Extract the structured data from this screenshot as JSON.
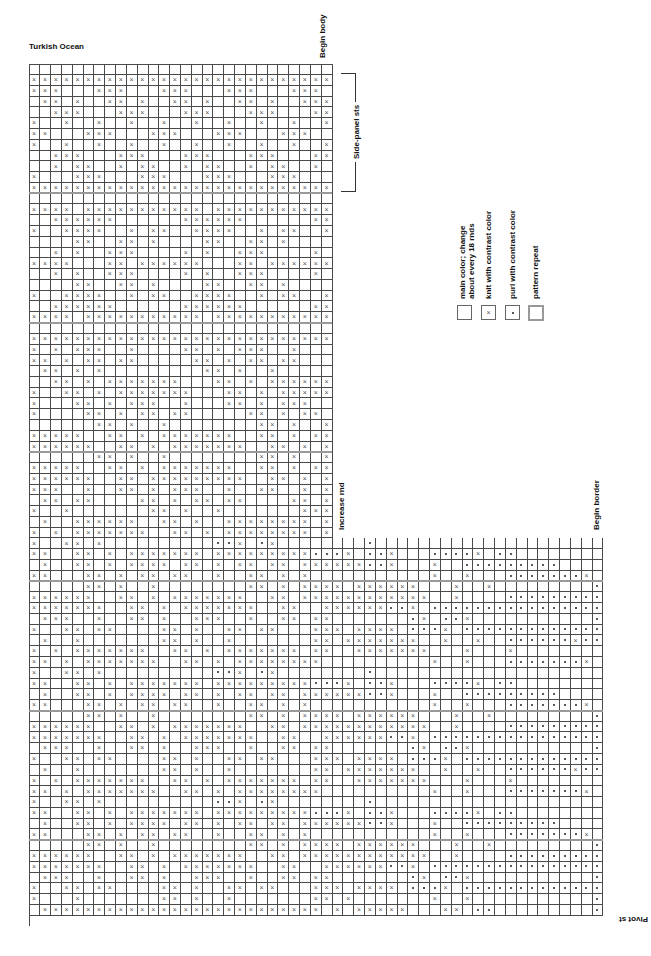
{
  "page": {
    "title": "Turkish Ocean",
    "labels": {
      "begin_body": "Begin body",
      "side_panel": "Side-panel sts",
      "increase_rnd": "Increase rnd",
      "begin_border": "Begin border",
      "pivot_st": "Pivot st"
    }
  },
  "legend": {
    "items": [
      {
        "symbol": "empty",
        "label_line1": "main color; change",
        "label_line2": "about every 18 rnds"
      },
      {
        "symbol": "x",
        "label_line1": "knit with contrast color",
        "label_line2": ""
      },
      {
        "symbol": "dot",
        "label_line1": "purl with contrast color",
        "label_line2": ""
      },
      {
        "symbol": "repeat-box",
        "label_line1": "pattern repeat",
        "label_line2": ""
      }
    ]
  },
  "chart_data": {
    "type": "table",
    "title": "Turkish Ocean",
    "symbols": {
      "x": "knit with contrast color",
      "o": "purl with contrast color",
      ".": "main color; change about every 18 rnds"
    },
    "annotations": [
      "Begin body",
      "Side-panel sts",
      "Increase rnd",
      "Begin border",
      "Pivot st"
    ],
    "upper_cols": 28,
    "lower_cols": 53,
    "total_rows": 80,
    "increase_row": 44,
    "rows": [
      "............................",
      "xxxxxxxxxxxxxxxxxxxxxxxxxxxx",
      "xxx...xxx...xxx...xxx...xxx.",
      ".xx.x..xx.x..xx.x..xx.x..xxx",
      "..xxx...xxx...xxx...xxx...xx",
      "x..x..x..x..x..x..x..x..x..x",
      "xx...xxx...xxx...xxx...xxx..",
      "x..x..x..x..x..x..x..x..x..x",
      "..xxx...xxx...xxx...xxx...xx",
      "..x.xx..x.xx..x.xx..x.xx..x.",
      "x...xxx...xxx...xxx...xxx...",
      "xxxxxxxxxxxxxxxxxxxxxxxxxxxx",
      "............................",
      "xxxx.xxxxxxxxxxx.xxxxxxxxxxx",
      "..xxxxxx......xxxxxx......xx",
      "x..xxxx..x.xx..xxxx..x.xx..x",
      "....xx..xx.x....xx..xx.x....",
      "..x.x..xxx....x.x..xxx....x.",
      "xxxx...xx.xxxxxx...xx.xxxxxx",
      "..x.x..xxx....x.x..xxx....x.",
      "....xx..xx.x....xx..xx.x....",
      "x..xxxx..x.xx..xxxx..x.xx..x",
      "..xxxxxx......xxxxxx......xx",
      "xxxx.xxxxxxxxxxx.xxxxxxxxxxx",
      "............................",
      "xxxxxxxxxxxxxxxxxxxxxxxxxxxx",
      "x.x.xxx..x....xx.x.xxx..x...",
      "xx.x.xx.xx.....xx.x.xx.xx...",
      ".xx.x.x.........xx.x..x.....",
      "..xx.x.xxxxxxx...xx.x.xxxxxx",
      "x..xx.x.xxxxxxx...xx.x.xxxxx",
      "x...xx.x.xxx..x...xx.x.xxx..",
      "x....xx.x.xx.xx.....xx.x.xx.",
      "......xx.x..x........xx.x..x",
      "xxxxx..xx.x.xxxxxxx..xx.x.xx",
      "xxxxxx..xx.x.xxxxxxx..xx.x.x",
      "......xx.x..x........xx.x..x",
      "xxxxx..xx.x.xxxxxxx..xx.x.xx",
      "xxxxxx..xx.xxxxxxxxx..xx.x.x",
      "xxx..x..xx.x.xxx..x..xx..x.x",
      ".xx.xx....xx.x.xx.xx....xx.x",
      "x..x.......xx.x..x.......xxx",
      ".x..xxxxxx..xx.x..xxxxxxxx.x",
      "x.x.xxxxxxx..xx.x.xxxxxxxx.x",
      "x..xx.x..........ooX.oX........o",
      "xx..xx.x.xxxxxxx.xxxxxxxxxoooX.oox...oooox.oo",
      ".x..xx.x.xxxx.xx.x.xx.xx.xxxxxxoox...x..ooooooooo",
      "xx...xx.x.xx.xx..x..xx.x.x...........x..x...ooooooox.oo",
      ".....xx.x..x........xx.x.xxxx.xxxxxx...x..x.........o",
      "xxxxxx..xx.x.xxxxxxx..xx.xxxxxxxxxxxx..x....ooooooooox.oo",
      "xxxxxxx..xx.x.xxxxxxx..xx..xxxxxxoox.oooooooooooooooo",
      ".xxx..x..xx.x..xxx..x..xx.xx.......ox.oox...........o",
      "x..xx.xx....xx.x..xx.xx...xxx.xxxx.ooox.oooooooooooooo",
      ".x..x.......xx.x..x.......xx.xxxxxxx..x..x..ooooooxooo",
      "x.x.xxxxxxx..xx.x.xxxxxxx.xx..xxxxxxx...x...x........o",
      "xx.x.xxxxxxx..xx.x.xxxxxxxx..........x..x...ooooooox.oo",
      "x..xx.x..........ooX.oX........o",
      "xx..xx.x.xxxxxxx.xxxxxxxxxoooX.oox...oooox.oo",
      ".x..xx.x.xxxx.xx.x.xx.xx.xxxxxxoox...x..ooooooooo",
      "xx...xx.x.xx.xx..x..xx.x.x...........x..x...ooooooox.oo",
      ".....xx.x..x........xx.x.xxxx.xxxxxx...x..x.........o",
      "xxxxxx..xx.x.xxxxxxx..xx.xxxxxxxxxxxx..x....ooooooooox.oo",
      "xxxxxxx..xx.x.xxxxxxx..xx..xxxxxxoox.oooooooooooooooo",
      ".xxx..x..xx.x..xxx..x..xx.xx.......ox.oox...........o",
      "x..xx.xx....xx.x..xx.xx...xxx.xxxx.ooox.oooooooooooooo",
      ".x..x.......xx.x..x.......xx.xxxxxxx..x..x..ooooooxooo",
      "x.x.xxxxxxx..xx.x.xxxxxxx.xx..xxxxxxx...x...x........o",
      "xx.x.xxxxxxx..xx.x.xxxxxxxx..........x..x...ooooooox.oo",
      "x..xx.x..........ooX.oX........o",
      "xx..xx.x.xxxxxxx.xxxxxxxxxoooX.oox...oooox.oo",
      ".x..xx.x.xxxx.xx.x.xx.xx.xxxxxxoox...x..ooooooooo",
      "xx...xx.x.xx.xx..x..xx.x.x...........x..x...ooooooox.oo",
      ".....xx.x..x........xx.x.xxxx.xxxxxx...x..x.........o",
      "xxxxxx..xx.x.xxxxxxx..xx.xxxxxxxxxxxx..x....ooooooooox.oo",
      "xxxxxxx..xx.x.xxxxxxx..xx..xxxxxxoox.oooooooooooooooo",
      ".xxx..x..xx.x..xxx..x..xx.xx.......ox.oox...........o",
      "x..xx.xx....xx.x..xx.xx...xxx.xxxx.ooox.oooooooooooooo",
      "x...x.......xx.x..x.......xx.x.......x..x...........o",
      ".xxxxxxxxxxxxxxxxxxxxxxxxxx.x.xxxxx...xx.oo.........o"
    ]
  }
}
